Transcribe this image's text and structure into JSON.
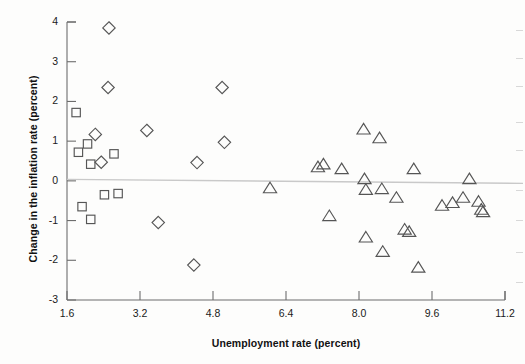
{
  "chart_data": {
    "type": "scatter",
    "title": "",
    "xlabel": "Unemployment rate (percent)",
    "ylabel": "Change in the inflation rate (percent)",
    "xlim": [
      1.6,
      11.2
    ],
    "ylim": [
      -3,
      4
    ],
    "xticks": [
      1.6,
      3.2,
      4.8,
      6.4,
      8.0,
      9.6,
      11.2
    ],
    "xticklabels": [
      "1.6",
      "3.2",
      "4.8",
      "6.4",
      "8.0",
      "9.6",
      "11.2"
    ],
    "yticks": [
      -3,
      -2,
      -1,
      0,
      1,
      2,
      3,
      4
    ],
    "yticklabels": [
      "-3",
      "-2",
      "-1",
      "0",
      "1",
      "2",
      "3",
      "4"
    ],
    "grid": false,
    "legend": false,
    "zero_line": true,
    "annotations": [],
    "series": [
      {
        "name": "squares",
        "marker": "square",
        "color": "#555555",
        "points": [
          {
            "x": 1.8,
            "y": 1.72
          },
          {
            "x": 1.85,
            "y": 0.72
          },
          {
            "x": 2.05,
            "y": 0.93
          },
          {
            "x": 2.12,
            "y": 0.42
          },
          {
            "x": 2.63,
            "y": 0.68
          },
          {
            "x": 2.42,
            "y": -0.35
          },
          {
            "x": 2.72,
            "y": -0.32
          },
          {
            "x": 1.93,
            "y": -0.65
          },
          {
            "x": 2.12,
            "y": -0.97
          }
        ]
      },
      {
        "name": "diamonds",
        "marker": "diamond",
        "color": "#555555",
        "points": [
          {
            "x": 2.52,
            "y": 3.85
          },
          {
            "x": 2.5,
            "y": 2.35
          },
          {
            "x": 2.22,
            "y": 1.17
          },
          {
            "x": 2.35,
            "y": 0.47
          },
          {
            "x": 3.35,
            "y": 1.27
          },
          {
            "x": 3.6,
            "y": -1.05
          },
          {
            "x": 4.38,
            "y": -2.12
          },
          {
            "x": 4.45,
            "y": 0.46
          },
          {
            "x": 5.0,
            "y": 2.35
          },
          {
            "x": 5.05,
            "y": 0.97
          }
        ]
      },
      {
        "name": "triangles",
        "marker": "triangle",
        "color": "#555555",
        "points": [
          {
            "x": 6.05,
            "y": -0.18
          },
          {
            "x": 7.1,
            "y": 0.35
          },
          {
            "x": 7.22,
            "y": 0.42
          },
          {
            "x": 7.35,
            "y": -0.88
          },
          {
            "x": 7.62,
            "y": 0.3
          },
          {
            "x": 8.1,
            "y": 1.3
          },
          {
            "x": 8.12,
            "y": 0.05
          },
          {
            "x": 8.15,
            "y": -0.22
          },
          {
            "x": 8.15,
            "y": -1.42
          },
          {
            "x": 8.45,
            "y": 1.08
          },
          {
            "x": 8.5,
            "y": -0.2
          },
          {
            "x": 8.52,
            "y": -1.78
          },
          {
            "x": 8.82,
            "y": -0.42
          },
          {
            "x": 9.0,
            "y": -1.22
          },
          {
            "x": 9.1,
            "y": -1.28
          },
          {
            "x": 9.2,
            "y": 0.3
          },
          {
            "x": 9.3,
            "y": -2.18
          },
          {
            "x": 9.82,
            "y": -0.62
          },
          {
            "x": 10.05,
            "y": -0.55
          },
          {
            "x": 10.28,
            "y": -0.42
          },
          {
            "x": 10.42,
            "y": 0.05
          },
          {
            "x": 10.62,
            "y": -0.52
          },
          {
            "x": 10.68,
            "y": -0.72
          },
          {
            "x": 10.72,
            "y": -0.78
          }
        ]
      }
    ]
  }
}
